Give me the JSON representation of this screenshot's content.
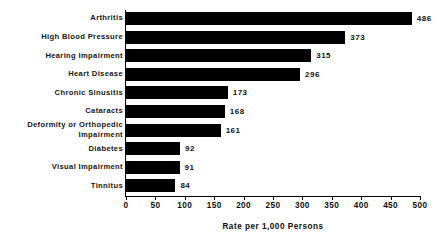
{
  "chart_data": {
    "type": "bar",
    "orientation": "horizontal",
    "title": "",
    "subtitle": "",
    "xlabel": "Rate per 1,000 Persons",
    "ylabel": "",
    "xlim": [
      0,
      500
    ],
    "xticks": [
      0,
      50,
      100,
      150,
      200,
      250,
      300,
      350,
      400,
      450,
      500
    ],
    "xtick_labels": [
      "0",
      "50",
      "100",
      "150",
      "200",
      "250",
      "300",
      "350",
      "400",
      "450",
      "500"
    ],
    "grid": false,
    "legend": false,
    "bar_color": "#000000",
    "background_color": "#ffffff",
    "categories": [
      "Arthritis",
      "High Blood Pressure",
      "Hearing Impairment",
      "Heart Disease",
      "Chronic Sinusitis",
      "Cataracts",
      "Deformity or Orthopedic Impairment",
      "Diabetes",
      "Visual Impairment",
      "Tinnitus"
    ],
    "values": [
      486,
      373,
      315,
      296,
      173,
      168,
      161,
      92,
      91,
      84
    ],
    "data_labels": [
      "486",
      "373",
      "315",
      "296",
      "173",
      "168",
      "161",
      "92",
      "91",
      "84"
    ],
    "bars": [
      {
        "category": "Arthritis",
        "label_lines": "Arthritis",
        "value": 486,
        "data_label": "486"
      },
      {
        "category": "High Blood Pressure",
        "label_lines": "High Blood Pressure",
        "value": 373,
        "data_label": "373"
      },
      {
        "category": "Hearing Impairment",
        "label_lines": "Hearing Impairment",
        "value": 315,
        "data_label": "315"
      },
      {
        "category": "Heart Disease",
        "label_lines": "Heart Disease",
        "value": 296,
        "data_label": "296"
      },
      {
        "category": "Chronic Sinusitis",
        "label_lines": "Chronic Sinusitis",
        "value": 173,
        "data_label": "173"
      },
      {
        "category": "Cataracts",
        "label_lines": "Cataracts",
        "value": 168,
        "data_label": "168"
      },
      {
        "category": "Deformity or Orthopedic Impairment",
        "label_lines": "Deformity or Orthopedic\nImpairment",
        "value": 161,
        "data_label": "161"
      },
      {
        "category": "Diabetes",
        "label_lines": "Diabetes",
        "value": 92,
        "data_label": "92"
      },
      {
        "category": "Visual Impairment",
        "label_lines": "Visual Impairment",
        "value": 91,
        "data_label": "91"
      },
      {
        "category": "Tinnitus",
        "label_lines": "Tinnitus",
        "value": 84,
        "data_label": "84"
      }
    ]
  }
}
